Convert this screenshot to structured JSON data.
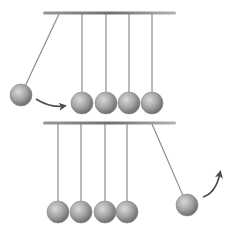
{
  "diagram": {
    "colors": {
      "bar": "#7a7a7a",
      "string": "#8c8c8c",
      "ball_light": "#d9d9d9",
      "ball_mid": "#a6a6a6",
      "ball_dark": "#6e6e6e",
      "arrow": "#4d4d4d"
    },
    "panels": [
      {
        "name": "before-collision",
        "bar": {
          "x1": 43,
          "x2": 176,
          "y": 13
        },
        "balls": [
          {
            "anchor_x": 59,
            "cx": 21,
            "cy": 95,
            "state": "raised-left"
          },
          {
            "anchor_x": 82,
            "cx": 82,
            "cy": 103,
            "state": "rest"
          },
          {
            "anchor_x": 106,
            "cx": 106,
            "cy": 103,
            "state": "rest"
          },
          {
            "anchor_x": 129,
            "cx": 129,
            "cy": 103,
            "state": "rest"
          },
          {
            "anchor_x": 152,
            "cx": 152,
            "cy": 103,
            "state": "rest"
          }
        ],
        "arrow": {
          "direction": "right",
          "from": [
            36,
            99
          ],
          "to": [
            64,
            106
          ]
        }
      },
      {
        "name": "after-collision",
        "bar": {
          "x1": 43,
          "x2": 176,
          "y": 123
        },
        "balls": [
          {
            "anchor_x": 58,
            "cx": 58,
            "cy": 212,
            "state": "rest"
          },
          {
            "anchor_x": 81,
            "cx": 81,
            "cy": 212,
            "state": "rest"
          },
          {
            "anchor_x": 105,
            "cx": 105,
            "cy": 212,
            "state": "rest"
          },
          {
            "anchor_x": 127,
            "cx": 127,
            "cy": 212,
            "state": "rest"
          },
          {
            "anchor_x": 152,
            "cx": 187,
            "cy": 205,
            "state": "raised-right"
          }
        ],
        "arrow": {
          "direction": "up-right",
          "from": [
            203,
            197
          ],
          "to": [
            220,
            173
          ]
        }
      }
    ]
  }
}
